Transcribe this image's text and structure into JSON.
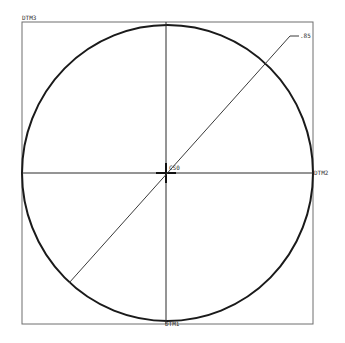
{
  "drawing": {
    "type": "cad-sketch",
    "datums": {
      "top_left": "DTM3",
      "right": "DTM2",
      "bottom": "DTM1"
    },
    "coordinate_system": "CS0",
    "dimension": {
      "label": ".85",
      "kind": "diameter"
    },
    "colors": {
      "background": "#ffffff",
      "circle": "#1a1a1a",
      "frame": "#6e6e6e",
      "axes": "#2a2a2a",
      "leader": "#3a3a3a",
      "text": "#333333"
    }
  }
}
